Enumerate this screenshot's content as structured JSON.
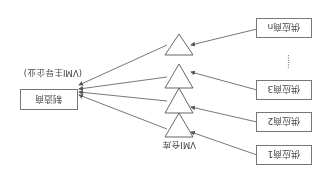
{
  "diagram": {
    "orientation": "rotated-180",
    "manufacturer": {
      "label": "制造商",
      "sublabel": "(VMI主导企业)"
    },
    "warehouse_label": "VMI仓库",
    "suppliers": [
      {
        "label": "供应商1"
      },
      {
        "label": "供应商2"
      },
      {
        "label": "供应商3"
      },
      {
        "label": "供应商n"
      }
    ],
    "ellipsis": "……",
    "colors": {
      "line": "#555555",
      "box_border": "#777777",
      "text": "#444444"
    }
  }
}
